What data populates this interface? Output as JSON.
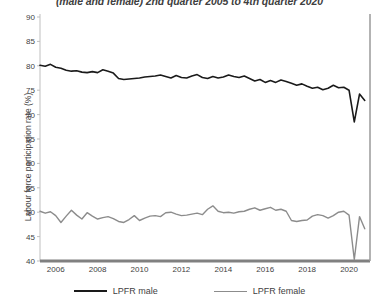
{
  "chart_data": {
    "type": "line",
    "title": "(male and female) 2nd quarter 2005 to 4th quarter 2020",
    "xlabel": "",
    "ylabel": "Labour force participation rate (%)",
    "ylim": [
      40,
      90
    ],
    "xlim": [
      2005.25,
      2021.0
    ],
    "yticks": [
      40,
      45,
      50,
      55,
      60,
      65,
      70,
      75,
      80,
      85,
      90
    ],
    "xticks": [
      2006,
      2008,
      2010,
      2012,
      2014,
      2016,
      2018,
      2020
    ],
    "grid": false,
    "legend_position": "bottom",
    "x": [
      2005.25,
      2005.5,
      2005.75,
      2006.0,
      2006.25,
      2006.5,
      2006.75,
      2007.0,
      2007.25,
      2007.5,
      2007.75,
      2008.0,
      2008.25,
      2008.5,
      2008.75,
      2009.0,
      2009.25,
      2009.5,
      2009.75,
      2010.0,
      2010.25,
      2010.5,
      2010.75,
      2011.0,
      2011.25,
      2011.5,
      2011.75,
      2012.0,
      2012.25,
      2012.5,
      2012.75,
      2013.0,
      2013.25,
      2013.5,
      2013.75,
      2014.0,
      2014.25,
      2014.5,
      2014.75,
      2015.0,
      2015.25,
      2015.5,
      2015.75,
      2016.0,
      2016.25,
      2016.5,
      2016.75,
      2017.0,
      2017.25,
      2017.5,
      2017.75,
      2018.0,
      2018.25,
      2018.5,
      2018.75,
      2019.0,
      2019.25,
      2019.5,
      2019.75,
      2020.0,
      2020.25,
      2020.5,
      2020.75
    ],
    "x_labels": [
      "2005Q2",
      "2005Q3",
      "2005Q4",
      "2006Q1",
      "2006Q2",
      "2006Q3",
      "2006Q4",
      "2007Q1",
      "2007Q2",
      "2007Q3",
      "2007Q4",
      "2008Q1",
      "2008Q2",
      "2008Q3",
      "2008Q4",
      "2009Q1",
      "2009Q2",
      "2009Q3",
      "2009Q4",
      "2010Q1",
      "2010Q2",
      "2010Q3",
      "2010Q4",
      "2011Q1",
      "2011Q2",
      "2011Q3",
      "2011Q4",
      "2012Q1",
      "2012Q2",
      "2012Q3",
      "2012Q4",
      "2013Q1",
      "2013Q2",
      "2013Q3",
      "2013Q4",
      "2014Q1",
      "2014Q2",
      "2014Q3",
      "2014Q4",
      "2015Q1",
      "2015Q2",
      "2015Q3",
      "2015Q4",
      "2016Q1",
      "2016Q2",
      "2016Q3",
      "2016Q4",
      "2017Q1",
      "2017Q2",
      "2017Q3",
      "2017Q4",
      "2018Q1",
      "2018Q2",
      "2018Q3",
      "2018Q4",
      "2019Q1",
      "2019Q2",
      "2019Q3",
      "2019Q4",
      "2020Q1",
      "2020Q2",
      "2020Q3",
      "2020Q4"
    ],
    "series": [
      {
        "name": "LPFR male",
        "color": "#1a1a1a",
        "width": 1.6,
        "values": [
          80.1,
          79.9,
          80.3,
          79.7,
          79.5,
          79.1,
          78.9,
          79.0,
          78.7,
          78.6,
          78.8,
          78.6,
          79.2,
          78.9,
          78.5,
          77.4,
          77.2,
          77.3,
          77.4,
          77.5,
          77.7,
          77.8,
          77.9,
          78.1,
          77.8,
          77.5,
          78.0,
          77.6,
          77.5,
          77.9,
          78.2,
          77.6,
          77.4,
          77.8,
          77.5,
          77.7,
          78.1,
          77.8,
          77.6,
          77.9,
          77.4,
          76.9,
          77.2,
          76.6,
          77.0,
          76.6,
          77.1,
          76.8,
          76.4,
          76.0,
          76.3,
          75.8,
          75.4,
          75.6,
          75.1,
          75.4,
          76.0,
          75.5,
          75.6,
          75.0,
          68.5,
          74.2,
          72.9
        ]
      },
      {
        "name": "LPFR female",
        "color": "#8c8c8c",
        "width": 1.4,
        "values": [
          50.2,
          49.8,
          50.1,
          49.3,
          47.9,
          49.2,
          50.4,
          49.4,
          48.6,
          49.9,
          49.2,
          48.6,
          48.9,
          49.1,
          48.7,
          48.1,
          47.9,
          48.5,
          49.3,
          48.3,
          48.8,
          49.2,
          49.3,
          49.1,
          49.9,
          50.0,
          49.6,
          49.3,
          49.4,
          49.6,
          49.8,
          49.5,
          50.6,
          51.3,
          50.2,
          49.9,
          50.0,
          49.8,
          50.1,
          50.2,
          50.6,
          50.9,
          50.4,
          50.7,
          51.0,
          50.4,
          50.6,
          50.2,
          48.3,
          48.1,
          48.3,
          48.4,
          49.2,
          49.5,
          49.3,
          48.8,
          49.3,
          50.0,
          50.2,
          49.4,
          40.3,
          49.1,
          46.6
        ]
      }
    ]
  },
  "legend": {
    "items": [
      {
        "label": "LPFR male",
        "color": "#1a1a1a",
        "width": 2.2
      },
      {
        "label": "LPFR female",
        "color": "#8c8c8c",
        "width": 1.6
      }
    ]
  },
  "axes": {
    "baseline_color": "#808080",
    "axis_color": "#bfbfbf",
    "right_border_color": "#9a9a9a"
  }
}
